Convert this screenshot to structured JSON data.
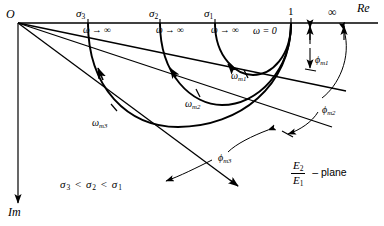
{
  "figure": {
    "plane_label": {
      "numerator": "E",
      "numerator_sub": "2",
      "denominator": "E",
      "denominator_sub": "1",
      "suffix": "– plane"
    },
    "condition": {
      "s1": "σ",
      "sub3": "3",
      "lt1": "<",
      "sub2": "2",
      "lt2": "<",
      "sub1": "1"
    },
    "condition_text": "σ3 < σ2 < σ1"
  },
  "axes": {
    "origin_label": "O",
    "real_axis_label": "Re",
    "imag_axis_label": "Im",
    "unit_label": "1",
    "infinity_label": "∞"
  },
  "sigma_ticks": [
    {
      "name": "sigma-3",
      "symbol": "σ",
      "sub": "3",
      "x": 76,
      "y": 8
    },
    {
      "name": "sigma-2",
      "symbol": "σ",
      "sub": "2",
      "x": 149,
      "y": 8
    },
    {
      "name": "sigma-1",
      "symbol": "σ",
      "sub": "1",
      "x": 204,
      "y": 8
    }
  ],
  "omega_infinity_labels": [
    {
      "name": "omega-inf-3",
      "text": "ω → ∞",
      "x": 83,
      "y": 26
    },
    {
      "name": "omega-inf-2",
      "text": "ω → ∞",
      "x": 156,
      "y": 26
    },
    {
      "name": "omega-inf-1",
      "text": "ω → ∞",
      "x": 211,
      "y": 26
    }
  ],
  "omega_zero_label": {
    "text": "ω = 0",
    "x": 253,
    "y": 26
  },
  "omega_m_labels": [
    {
      "name": "omega-m1",
      "symbol": "ω",
      "sub": "m1",
      "x": 231,
      "y": 71
    },
    {
      "name": "omega-m2",
      "symbol": "ω",
      "sub": "m2",
      "x": 185,
      "y": 99
    },
    {
      "name": "omega-m3",
      "symbol": "ω",
      "sub": "m3",
      "x": 92,
      "y": 118
    }
  ],
  "phi_labels": [
    {
      "name": "phi-m1",
      "symbol": "ϕ",
      "sub": "m1",
      "x": 315,
      "y": 55
    },
    {
      "name": "phi-m2",
      "symbol": "ϕ",
      "sub": "m2",
      "x": 322,
      "y": 105
    },
    {
      "name": "phi-m3",
      "symbol": "ϕ",
      "sub": "m3",
      "x": 218,
      "y": 153
    }
  ],
  "colors": {
    "ink": "#000000",
    "background": "#ffffff"
  },
  "geometry": {
    "origin": {
      "x": 18,
      "y": 23
    },
    "re_axis_y": 23,
    "unit_point_x": 291,
    "circle_left_x": [
      215,
      160,
      88
    ],
    "circle_bottom_y": [
      75,
      105,
      126
    ]
  }
}
